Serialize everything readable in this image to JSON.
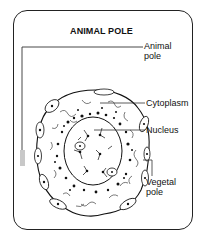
{
  "diagram": {
    "title": "ANIMAL POLE",
    "labels": {
      "animal_pole": [
        "Animal",
        "pole"
      ],
      "cytoplasm": "Cytoplasm",
      "nucleus": "Nucleus",
      "vegetal_pole": [
        "Vegetal",
        "pole"
      ]
    },
    "colors": {
      "ink": "#111111",
      "frame": "#222222",
      "background": "#ffffff",
      "shading": "#b8b8b8"
    }
  }
}
